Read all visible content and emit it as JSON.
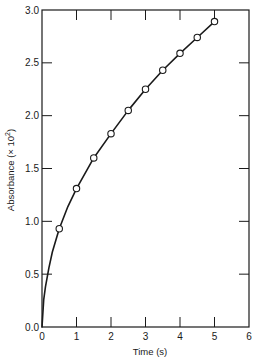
{
  "chart_data": {
    "type": "scatter",
    "title": "",
    "xlabel": "Time (s)",
    "ylabel": "Absorbance (× 10²)",
    "ylabel_parts": {
      "main": "Absorbance (",
      "times": "× 10",
      "sup": "2",
      "close": ")"
    },
    "xlim": [
      0,
      6
    ],
    "ylim": [
      0,
      3.0
    ],
    "x_ticks": [
      0,
      1,
      2,
      3,
      4,
      5,
      6
    ],
    "x_tick_labels": [
      "0",
      "1",
      "2",
      "3",
      "4",
      "5",
      "6"
    ],
    "y_ticks": [
      0,
      0.5,
      1.0,
      1.5,
      2.0,
      2.5,
      3.0
    ],
    "y_tick_labels": [
      "0.0",
      "0.5",
      "1.0",
      "1.5",
      "2.0",
      "2.5",
      "3.0"
    ],
    "grid": false,
    "legend": null,
    "series": [
      {
        "name": "Measured absorbance",
        "marker": "open-circle",
        "x": [
          0.5,
          1.0,
          1.5,
          2.0,
          2.5,
          3.0,
          3.5,
          4.0,
          4.5,
          5.0
        ],
        "y": [
          0.93,
          1.31,
          1.6,
          1.83,
          2.05,
          2.25,
          2.43,
          2.59,
          2.74,
          2.89
        ]
      },
      {
        "name": "Fitted curve",
        "style": "solid-line",
        "x": [
          0,
          0.05,
          0.1,
          0.2,
          0.3,
          0.5,
          0.75,
          1.0,
          1.5,
          2.0,
          2.5,
          3.0,
          3.5,
          4.0,
          4.5,
          5.0
        ],
        "y": [
          0,
          0.26,
          0.38,
          0.56,
          0.71,
          0.93,
          1.14,
          1.31,
          1.6,
          1.83,
          2.05,
          2.25,
          2.43,
          2.59,
          2.74,
          2.89
        ]
      }
    ]
  },
  "colors": {
    "ink": "#1a1a1a",
    "background": "#ffffff"
  }
}
